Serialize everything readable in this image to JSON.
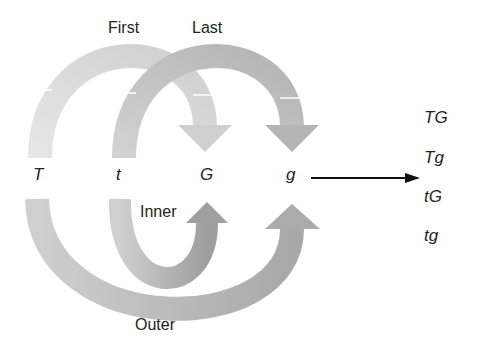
{
  "diagram": {
    "title_labels": {
      "first": "First",
      "last": "Last",
      "inner": "Inner",
      "outer": "Outer"
    },
    "alleles": [
      "T",
      "t",
      "G",
      "g"
    ],
    "results": [
      "TG",
      "Tg",
      "tG",
      "tg"
    ],
    "colors": {
      "first_arc": "#d9d9d9",
      "last_arc": "#bdbdbd",
      "inner_arc": "#a9a9a9",
      "outer_arc": "#bcbcbc",
      "result_arrow": "#111111",
      "text": "#222222"
    }
  }
}
